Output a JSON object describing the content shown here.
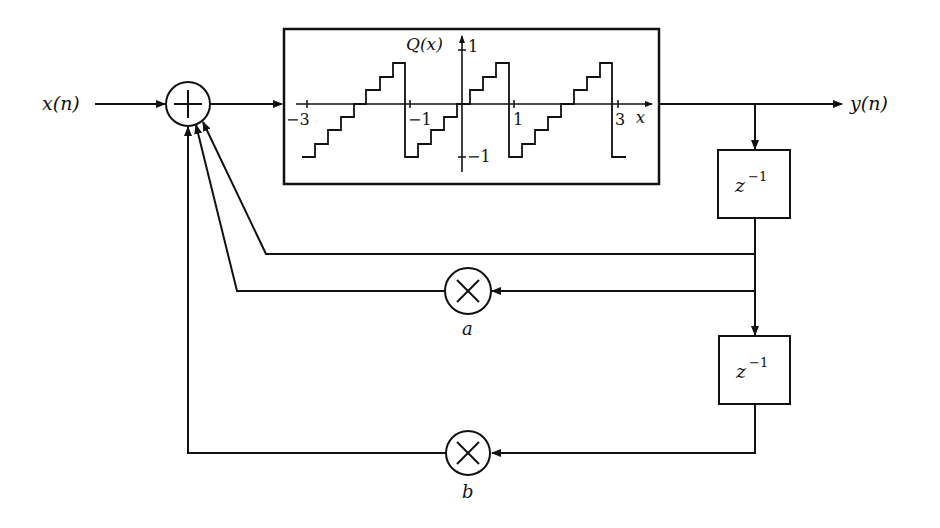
{
  "diagram": {
    "input_label": "x(n)",
    "output_label": "y(n)",
    "summer_symbol": "+",
    "quantizer": {
      "y_axis_label": "Q(x)",
      "x_axis_label": "x",
      "x_ticks": [
        "−3",
        "−1",
        "1",
        "3"
      ],
      "y_ticks": [
        "1",
        "−1"
      ]
    },
    "delay_1": {
      "base": "z",
      "exponent": "−1"
    },
    "delay_2": {
      "base": "z",
      "exponent": "−1"
    },
    "multiplier_a": {
      "symbol": "×",
      "label": "a"
    },
    "multiplier_b": {
      "symbol": "×",
      "label": "b"
    },
    "colors": {
      "stroke": "#111111",
      "background": "#ffffff"
    }
  }
}
